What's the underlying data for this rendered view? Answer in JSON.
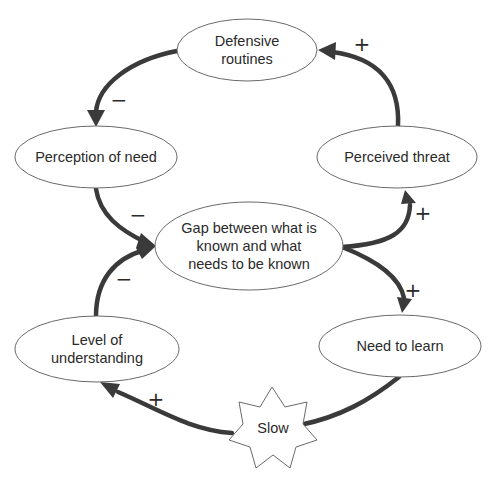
{
  "diagram": {
    "type": "causal-loop",
    "nodes": {
      "defensive_routines": {
        "label_line1": "Defensive",
        "label_line2": "routines"
      },
      "perception_of_need": {
        "label": "Perception of need"
      },
      "perceived_threat": {
        "label": "Perceived threat"
      },
      "gap": {
        "label_line1": "Gap between what is",
        "label_line2": "known and what",
        "label_line3": "needs to be known"
      },
      "need_to_learn": {
        "label": "Need to learn"
      },
      "level_of_understanding": {
        "label_line1": "Level of",
        "label_line2": "understanding"
      },
      "slow": {
        "label": "Slow"
      }
    },
    "edges": [
      {
        "from": "Defensive routines",
        "to": "Perception of need",
        "polarity": "−"
      },
      {
        "from": "Perceived threat",
        "to": "Defensive routines",
        "polarity": "+"
      },
      {
        "from": "Perception of need",
        "to": "Gap between what is known and what needs to be known",
        "polarity": "−"
      },
      {
        "from": "Level of understanding",
        "to": "Gap between what is known and what needs to be known",
        "polarity": "−"
      },
      {
        "from": "Gap between what is known and what needs to be known",
        "to": "Perceived threat",
        "polarity": "+"
      },
      {
        "from": "Gap between what is known and what needs to be known",
        "to": "Need to learn",
        "polarity": "+"
      },
      {
        "from": "Need to learn",
        "to": "Level of understanding",
        "polarity": "+",
        "delay": "Slow"
      }
    ],
    "signs": {
      "def_to_perc": "−",
      "threat_to_def": "+",
      "perc_to_gap": "−",
      "level_to_gap": "−",
      "gap_to_threat": "+",
      "gap_to_need": "+",
      "need_to_level": "+"
    },
    "colors": {
      "arrow": "#3a3a3a",
      "node_stroke": "#6a6a6a",
      "text": "#2a2a2a",
      "background": "#ffffff"
    }
  }
}
